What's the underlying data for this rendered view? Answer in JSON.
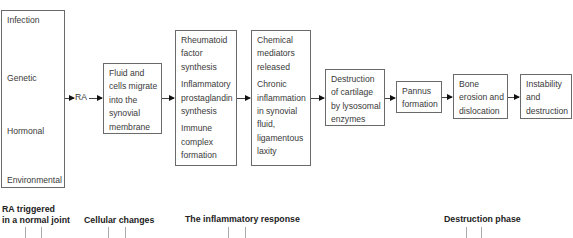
{
  "diagram": {
    "factors_box": {
      "items": [
        "Infection",
        "Genetic",
        "Hormonal",
        "Environmental"
      ]
    },
    "ra_label": "RA",
    "boxes": [
      {
        "id": "fluid",
        "paragraphs": [
          "Fluid and cells migrate into the synovial membrane"
        ]
      },
      {
        "id": "rheumatoid",
        "paragraphs": [
          "Rheumatoid factor synthesis",
          "Inflammatory prostaglandin synthesis",
          "Immune complex formation"
        ]
      },
      {
        "id": "chemical",
        "paragraphs": [
          "Chemical mediators released",
          "Chronic inflammation in synovial fluid, ligamentous laxity"
        ]
      },
      {
        "id": "cartilage",
        "paragraphs": [
          "Destruction of cartilage by lysosomal enzymes"
        ]
      },
      {
        "id": "pannus",
        "paragraphs": [
          "Pannus formation"
        ]
      },
      {
        "id": "bone",
        "paragraphs": [
          "Bone erosion and dislocation"
        ]
      },
      {
        "id": "instability",
        "paragraphs": [
          "Instability and destruction"
        ]
      }
    ],
    "phases": [
      {
        "label_line1": "RA triggered",
        "label_line2": "in a normal joint"
      },
      {
        "label": "Cellular changes"
      },
      {
        "label": "The inflammatory response"
      },
      {
        "label": "Destruction phase"
      }
    ]
  }
}
